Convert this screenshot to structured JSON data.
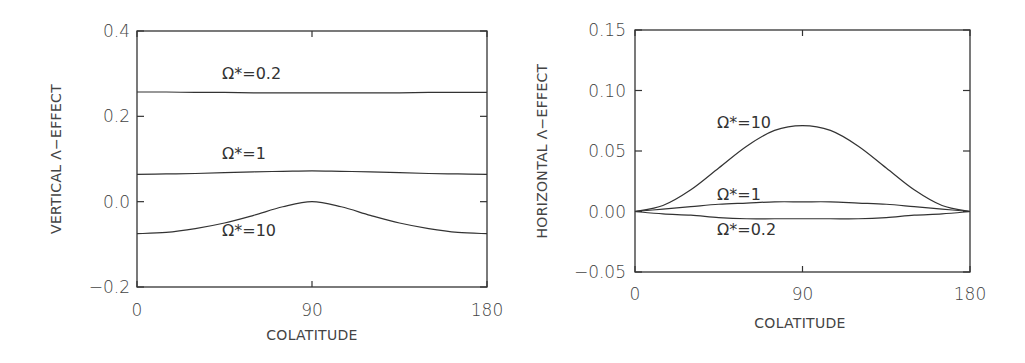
{
  "chart_data": [
    {
      "type": "line",
      "title": "",
      "xlabel": "COLATITUDE",
      "ylabel": "VERTICAL Λ−EFFECT",
      "xlim": [
        0,
        180
      ],
      "ylim": [
        -0.2,
        0.4
      ],
      "xticks": [
        0,
        90,
        180
      ],
      "xtick_labels": [
        "0",
        "90",
        "180"
      ],
      "yticks": [
        -0.2,
        0.0,
        0.2,
        0.4
      ],
      "ytick_labels": [
        "−0.2",
        "0.0",
        "0.2",
        "0.4"
      ],
      "grid": false,
      "legend": "inline labels",
      "x": [
        0,
        15,
        30,
        45,
        60,
        75,
        90,
        105,
        120,
        135,
        150,
        165,
        180
      ],
      "series": [
        {
          "name": "Ω*=0.2",
          "label": "Ω*=0.2",
          "values": [
            0.257,
            0.257,
            0.256,
            0.256,
            0.255,
            0.255,
            0.255,
            0.255,
            0.255,
            0.255,
            0.256,
            0.256,
            0.256
          ]
        },
        {
          "name": "Ω*=1",
          "label": "Ω*=1",
          "values": [
            0.064,
            0.065,
            0.066,
            0.068,
            0.07,
            0.071,
            0.072,
            0.071,
            0.07,
            0.068,
            0.066,
            0.065,
            0.064
          ]
        },
        {
          "name": "Ω*=10",
          "label": "Ω*=10",
          "values": [
            -0.075,
            -0.072,
            -0.063,
            -0.05,
            -0.032,
            -0.012,
            0.0,
            -0.012,
            -0.032,
            -0.05,
            -0.063,
            -0.072,
            -0.075
          ]
        }
      ]
    },
    {
      "type": "line",
      "title": "",
      "xlabel": "COLATITUDE",
      "ylabel": "HORIZONTAL Λ−EFFECT",
      "xlim": [
        0,
        180
      ],
      "ylim": [
        -0.05,
        0.15
      ],
      "xticks": [
        0,
        90,
        180
      ],
      "xtick_labels": [
        "0",
        "90",
        "180"
      ],
      "yticks": [
        -0.05,
        0.0,
        0.05,
        0.1,
        0.15
      ],
      "ytick_labels": [
        "−0.05",
        "0.00",
        "0.05",
        "0.10",
        "0.15"
      ],
      "grid": false,
      "legend": "inline labels",
      "x": [
        0,
        15,
        30,
        45,
        60,
        75,
        90,
        105,
        120,
        135,
        150,
        165,
        180
      ],
      "series": [
        {
          "name": "Ω*=10",
          "label": "Ω*=10",
          "values": [
            0.0,
            0.005,
            0.018,
            0.036,
            0.054,
            0.067,
            0.071,
            0.067,
            0.054,
            0.036,
            0.018,
            0.005,
            0.0
          ]
        },
        {
          "name": "Ω*=1",
          "label": "Ω*=1",
          "values": [
            0.0,
            0.002,
            0.004,
            0.006,
            0.007,
            0.008,
            0.008,
            0.008,
            0.007,
            0.006,
            0.004,
            0.002,
            0.0
          ]
        },
        {
          "name": "Ω*=0.2",
          "label": "Ω*=0.2",
          "values": [
            0.0,
            -0.002,
            -0.003,
            -0.005,
            -0.006,
            -0.006,
            -0.006,
            -0.006,
            -0.006,
            -0.005,
            -0.003,
            -0.002,
            0.0
          ]
        }
      ]
    }
  ]
}
